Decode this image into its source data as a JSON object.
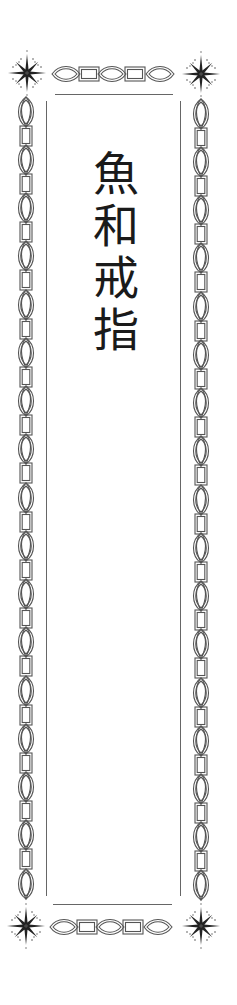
{
  "label": {
    "title": "魚和戒指",
    "characters": [
      "魚",
      "和",
      "戒",
      "指"
    ],
    "orientation": "vertical"
  },
  "ornaments": {
    "corner_icon": "starburst-icon",
    "border_pattern": "chain-link (vesica + rectangle)",
    "stroke_color": "#555555",
    "text_color": "#1a1a1a",
    "background_color": "#ffffff"
  }
}
